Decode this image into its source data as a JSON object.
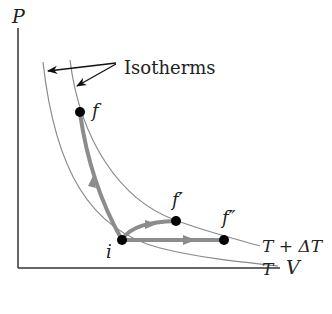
{
  "diagram": {
    "axes": {
      "y_label": "P",
      "x_label": "V"
    },
    "callout_label": "Isotherms",
    "isotherms": [
      {
        "name": "low",
        "label": "T"
      },
      {
        "name": "high",
        "label": "T + ΔT"
      }
    ],
    "points": [
      {
        "id": "i",
        "label": "i"
      },
      {
        "id": "f",
        "label": "f"
      },
      {
        "id": "f_prime",
        "label": "f′"
      },
      {
        "id": "f_double_prime",
        "label": "f″"
      }
    ],
    "paths": [
      {
        "from": "i",
        "to": "f",
        "type": "constant volume-ish, steep rise"
      },
      {
        "from": "i",
        "to": "f′",
        "type": "curved path"
      },
      {
        "from": "i",
        "to": "f″",
        "type": "constant pressure"
      }
    ],
    "colors": {
      "axis": "#333333",
      "isotherm": "#8a8a8a",
      "path": "#8c8c8c",
      "point": "#000000"
    }
  }
}
